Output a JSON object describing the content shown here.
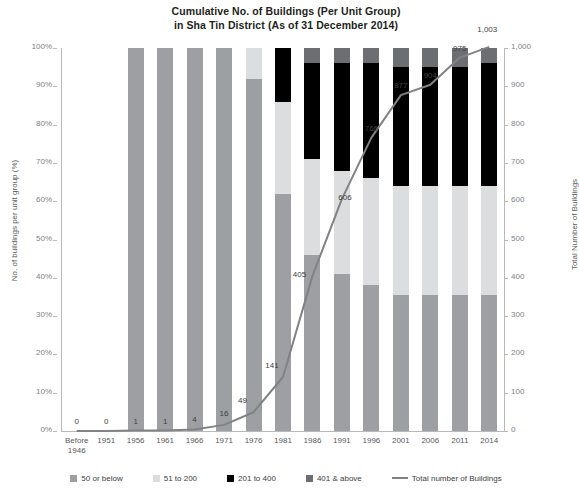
{
  "chart_data": {
    "type": "bar",
    "title": "Cumulative No. of Buildings (Per Unit Group)\nin Sha Tin District (As of 31 December 2014)",
    "title_line1": "Cumulative No. of Buildings (Per Unit Group)",
    "title_line2": "in Sha Tin District (As of 31 December 2014)",
    "subtitle": "",
    "xlabel": "",
    "ylabel": "No. of buildings per unit group (%)",
    "y2label": "Total Number of Buildings",
    "ylim": [
      0,
      100
    ],
    "y2lim": [
      0,
      1000
    ],
    "grid": false,
    "legend_position": "bottom",
    "categories": [
      "Before 1946",
      "1951",
      "1956",
      "1961",
      "1966",
      "1971",
      "1976",
      "1981",
      "1986",
      "1991",
      "1996",
      "2001",
      "2006",
      "2011",
      "2014"
    ],
    "ytick_labels": [
      "0%",
      "10%",
      "20%",
      "30%",
      "40%",
      "50%",
      "60%",
      "70%",
      "80%",
      "90%",
      "100%"
    ],
    "ytick_values": [
      0,
      10,
      20,
      30,
      40,
      50,
      60,
      70,
      80,
      90,
      100
    ],
    "y2tick_labels": [
      "0",
      "100",
      "200",
      "300",
      "400",
      "500",
      "600",
      "700",
      "800",
      "900",
      "1,000"
    ],
    "y2tick_values": [
      0,
      100,
      200,
      300,
      400,
      500,
      600,
      700,
      800,
      900,
      1000
    ],
    "series": [
      {
        "name": "50 or below",
        "color": "#9d9fa2",
        "values": [
          0,
          0,
          100,
          100,
          100,
          100,
          92,
          62,
          46,
          41,
          38,
          35.5,
          35.5,
          35.5,
          35.5
        ]
      },
      {
        "name": "51 to 200",
        "color": "#dcdddf",
        "values": [
          0,
          0,
          0,
          0,
          0,
          0,
          8,
          24,
          25,
          27,
          28,
          28.5,
          28.5,
          28.5,
          28.5
        ]
      },
      {
        "name": "201 to 400",
        "color": "#000000",
        "values": [
          0,
          0,
          0,
          0,
          0,
          0,
          0,
          14,
          25,
          28,
          30,
          31,
          31,
          31,
          32
        ]
      },
      {
        "name": "401 & above",
        "color": "#6d6e71",
        "values": [
          0,
          0,
          0,
          0,
          0,
          0,
          0,
          0,
          4,
          4,
          4,
          5,
          5,
          5,
          4
        ]
      }
    ],
    "line_series": {
      "name": "Total number of Buildings",
      "color": "#808285",
      "values": [
        0,
        0,
        1,
        1,
        4,
        16,
        49,
        141,
        405,
        606,
        766,
        877,
        904,
        975,
        1003
      ],
      "labels": [
        "0",
        "0",
        "1",
        "1",
        "4",
        "16",
        "49",
        "141",
        "405",
        "606",
        "766",
        "877",
        "904",
        "975",
        "1,003"
      ]
    }
  },
  "legend": {
    "items": [
      {
        "label": "50 or below",
        "color": "#9d9fa2",
        "type": "swatch"
      },
      {
        "label": "51 to 200",
        "color": "#dcdddf",
        "type": "swatch"
      },
      {
        "label": "201 to 400",
        "color": "#000000",
        "type": "swatch"
      },
      {
        "label": "401 & above",
        "color": "#6d6e71",
        "type": "swatch"
      },
      {
        "label": "Total number of Buildings",
        "color": "#808285",
        "type": "line"
      }
    ]
  },
  "footnote": ""
}
